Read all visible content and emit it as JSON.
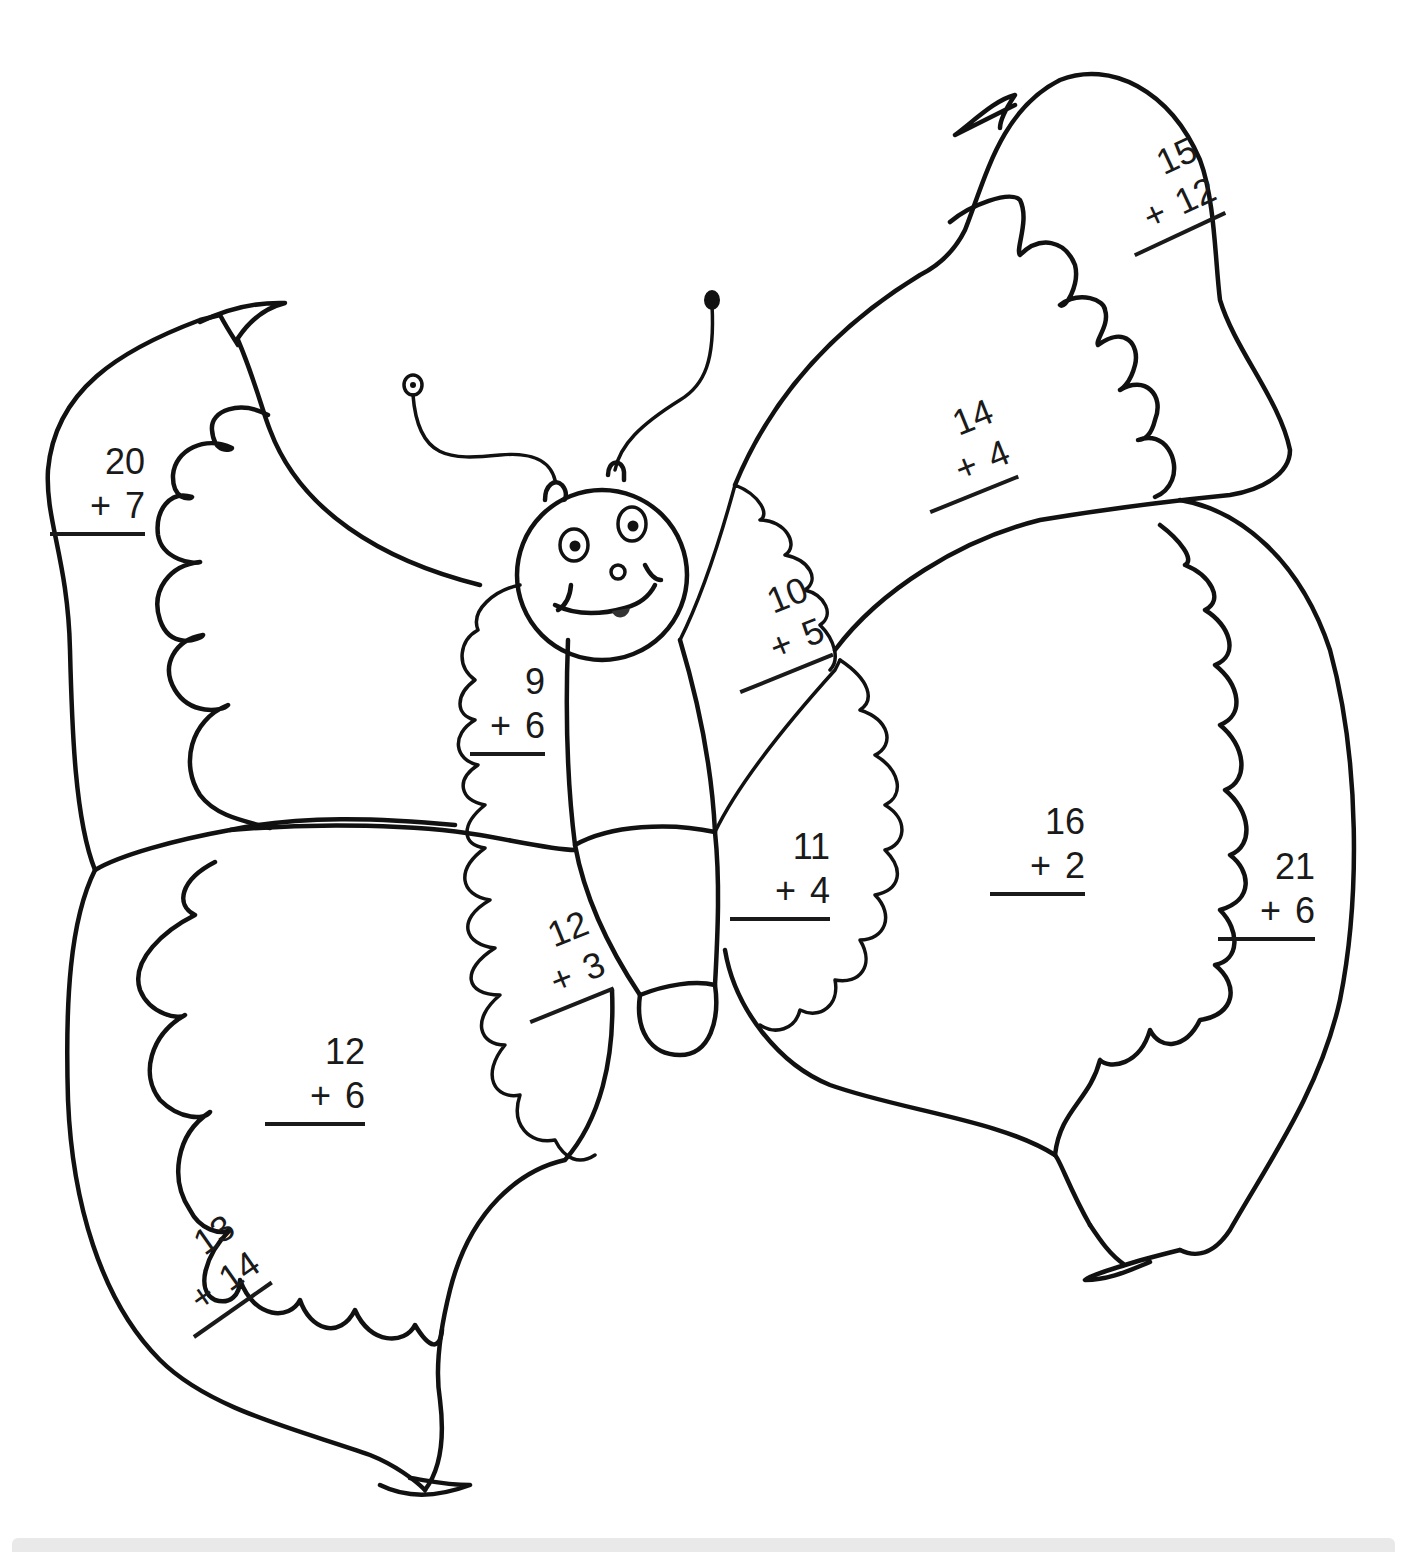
{
  "worksheet": {
    "subject": "butterfly addition coloring page",
    "colors": {
      "ink": "#111111",
      "paper": "#ffffff",
      "footer_bar": "#e9e9e9"
    },
    "problems": [
      {
        "id": "left-upper-outer",
        "top": "20",
        "operator": "+",
        "bottom": "7",
        "x": 50,
        "y": 440,
        "w": 95,
        "rotate": 0
      },
      {
        "id": "left-upper-inner",
        "top": "9",
        "operator": "+",
        "bottom": "6",
        "x": 470,
        "y": 660,
        "w": 75,
        "rotate": 0
      },
      {
        "id": "left-lower-inner",
        "top": "12",
        "operator": "+",
        "bottom": "3",
        "x": 495,
        "y": 935,
        "w": 90,
        "rotate": -22
      },
      {
        "id": "left-lower-center",
        "top": "12",
        "operator": "+",
        "bottom": "6",
        "x": 265,
        "y": 1030,
        "w": 100,
        "rotate": 0
      },
      {
        "id": "left-lower-outer",
        "top": "13",
        "operator": "+",
        "bottom": "14",
        "x": 140,
        "y": 1260,
        "w": 95,
        "rotate": -35
      },
      {
        "id": "right-upper-inner",
        "top": "10",
        "operator": "+",
        "bottom": "5",
        "x": 705,
        "y": 605,
        "w": 100,
        "rotate": -22
      },
      {
        "id": "right-upper-center",
        "top": "14",
        "operator": "+",
        "bottom": "4",
        "x": 895,
        "y": 425,
        "w": 95,
        "rotate": -22
      },
      {
        "id": "right-upper-outer",
        "top": "15",
        "operator": "+",
        "bottom": "12",
        "x": 1095,
        "y": 170,
        "w": 100,
        "rotate": -25
      },
      {
        "id": "right-lower-inner",
        "top": "11",
        "operator": "+",
        "bottom": "4",
        "x": 730,
        "y": 825,
        "w": 100,
        "rotate": 0
      },
      {
        "id": "right-lower-center",
        "top": "16",
        "operator": "+",
        "bottom": "2",
        "x": 990,
        "y": 800,
        "w": 95,
        "rotate": 0
      },
      {
        "id": "right-lower-outer",
        "top": "21",
        "operator": "+",
        "bottom": "6",
        "x": 1218,
        "y": 845,
        "w": 97,
        "rotate": 0
      }
    ]
  }
}
